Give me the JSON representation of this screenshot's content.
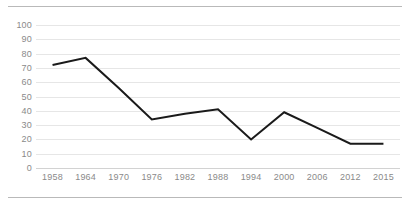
{
  "frame": {
    "top_rule": "",
    "bottom_rule": ""
  },
  "chart_data": {
    "type": "line",
    "title": "",
    "subtitle": "",
    "xlabel": "",
    "ylabel": "",
    "categories": [
      "1958",
      "1964",
      "1970",
      "1976",
      "1982",
      "1988",
      "1994",
      "2000",
      "2006",
      "2012",
      "2015"
    ],
    "values": [
      72,
      77,
      56,
      34,
      38,
      41,
      20,
      39,
      28,
      17,
      17
    ],
    "series": [
      {
        "name": "",
        "values": [
          72,
          77,
          56,
          34,
          38,
          41,
          20,
          39,
          28,
          17,
          17
        ],
        "color": "#1a1a1a",
        "line_width": 2,
        "markers": false
      }
    ],
    "ylim": [
      0,
      100
    ],
    "ytick_labels": [
      "100",
      "90",
      "80",
      "70",
      "60",
      "50",
      "40",
      "30",
      "20",
      "10",
      "0"
    ],
    "ytick_values": [
      100,
      90,
      80,
      70,
      60,
      50,
      40,
      30,
      20,
      10,
      0
    ],
    "grid": {
      "horizontal": true,
      "vertical": false,
      "color": "#e6e6e6"
    },
    "legend": {
      "visible": false,
      "position": "none",
      "entries": []
    },
    "axis_label_color": "#8a8a8a",
    "background_color": "#ffffff"
  }
}
